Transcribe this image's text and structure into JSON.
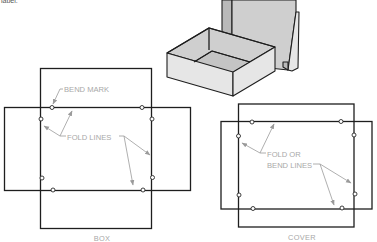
{
  "figure": {
    "top_fragment_text": "label:",
    "box_illustration": "open-box-with-lid"
  },
  "box_pattern": {
    "caption": "BOX",
    "labels": {
      "bend_mark": "BEND MARK",
      "fold_lines": "FOLD LINES"
    },
    "bend_mark_count": 8
  },
  "cover_pattern": {
    "caption": "COVER",
    "labels": {
      "line1": "FOLD OR",
      "line2": "BEND LINES"
    },
    "bend_mark_count": 8
  },
  "colors": {
    "outline": "#1e1e1e",
    "label_text": "#a8a8a8",
    "leader": "#9a9a9a",
    "box_light": "#e6e6e6",
    "box_shadow": "#b9b9b9"
  }
}
